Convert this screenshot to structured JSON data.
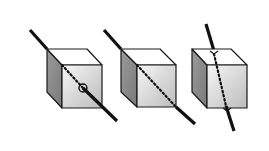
{
  "diagram": {
    "colors": {
      "background": "#ffffff",
      "outline": "#1a1a1a",
      "line": "#111111",
      "top_face": "#ffffff",
      "side_face": "#8c8c8c",
      "front_face_light": "#f4f4f4",
      "front_face_dark": "#bdbdbd"
    },
    "cubes": [
      {
        "id": "cube-1",
        "top": [
          [
            47,
            49
          ],
          [
            87,
            49
          ],
          [
            102,
            65
          ],
          [
            62,
            65
          ]
        ],
        "side": [
          [
            47,
            49
          ],
          [
            62,
            65
          ],
          [
            62,
            108
          ],
          [
            47,
            92
          ]
        ],
        "front": [
          [
            62,
            65
          ],
          [
            102,
            65
          ],
          [
            102,
            108
          ],
          [
            62,
            108
          ]
        ],
        "line_outside_1": [
          [
            30,
            30
          ],
          [
            47,
            49
          ]
        ],
        "line_hidden": [
          [
            62,
            65
          ],
          [
            83,
            88
          ]
        ],
        "line_outside_2": [
          [
            83,
            88
          ],
          [
            117,
            121
          ]
        ],
        "piercing_marker": {
          "type": "circle",
          "cx": 83,
          "cy": 88,
          "r": 4
        }
      },
      {
        "id": "cube-2",
        "top": [
          [
            121,
            49
          ],
          [
            160,
            49
          ],
          [
            176,
            65
          ],
          [
            137,
            65
          ]
        ],
        "side": [
          [
            121,
            49
          ],
          [
            137,
            65
          ],
          [
            137,
            107
          ],
          [
            121,
            92
          ]
        ],
        "front": [
          [
            137,
            65
          ],
          [
            176,
            65
          ],
          [
            176,
            107
          ],
          [
            137,
            107
          ]
        ],
        "line_outside_1": [
          [
            104,
            30
          ],
          [
            121,
            49
          ]
        ],
        "line_hidden": [
          [
            137,
            65
          ],
          [
            176,
            107
          ]
        ],
        "line_outside_2": [
          [
            176,
            107
          ],
          [
            195,
            124
          ]
        ],
        "piercing_marker": null
      },
      {
        "id": "cube-3",
        "top": [
          [
            192,
            49
          ],
          [
            231,
            49
          ],
          [
            247,
            65
          ],
          [
            207,
            65
          ]
        ],
        "side": [
          [
            192,
            49
          ],
          [
            207,
            65
          ],
          [
            207,
            108
          ],
          [
            192,
            92
          ]
        ],
        "front": [
          [
            207,
            65
          ],
          [
            247,
            65
          ],
          [
            247,
            108
          ],
          [
            207,
            108
          ]
        ],
        "line_outside_1": [
          [
            206,
            24
          ],
          [
            214,
            51
          ]
        ],
        "line_hidden": [
          [
            214,
            54
          ],
          [
            226,
            106
          ]
        ],
        "line_outside_2": [
          [
            226,
            106
          ],
          [
            234,
            131
          ]
        ],
        "notches": [
          [
            214,
            51
          ],
          [
            227,
            108
          ]
        ],
        "piercing_marker": null
      }
    ]
  }
}
